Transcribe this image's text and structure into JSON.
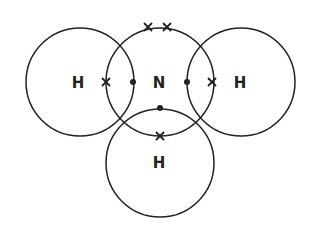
{
  "diagram": {
    "molecule": "NH3",
    "atoms": [
      {
        "id": "H-left",
        "symbol": "H",
        "cx": 80,
        "cy": 82,
        "r": 54
      },
      {
        "id": "N-center",
        "symbol": "N",
        "cx": 160,
        "cy": 82,
        "r": 54
      },
      {
        "id": "H-right",
        "symbol": "H",
        "cx": 241,
        "cy": 82,
        "r": 54
      },
      {
        "id": "H-bottom",
        "symbol": "H",
        "cx": 160,
        "cy": 163,
        "r": 54
      }
    ],
    "labels": [
      {
        "text": "H",
        "x": 78,
        "y": 83
      },
      {
        "text": "N",
        "x": 159,
        "y": 83
      },
      {
        "text": "H",
        "x": 240,
        "y": 83
      },
      {
        "text": "H",
        "x": 159,
        "y": 163
      }
    ],
    "electrons": {
      "dots": [
        {
          "x": 133,
          "y": 82,
          "owner": "N"
        },
        {
          "x": 187,
          "y": 82,
          "owner": "N"
        },
        {
          "x": 160,
          "y": 108,
          "owner": "N"
        }
      ],
      "crosses": [
        {
          "x": 148,
          "y": 27,
          "owner": "N-lone-pair"
        },
        {
          "x": 167,
          "y": 27,
          "owner": "N-lone-pair"
        },
        {
          "x": 106,
          "y": 82,
          "owner": "H-left"
        },
        {
          "x": 212,
          "y": 82,
          "owner": "H-right"
        },
        {
          "x": 160,
          "y": 136,
          "owner": "H-bottom"
        }
      ]
    },
    "colors": {
      "stroke": "#222222",
      "background": "#ffffff"
    }
  }
}
